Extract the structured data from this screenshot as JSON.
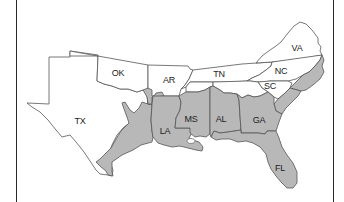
{
  "map": {
    "title": "",
    "colors": {
      "background": "#ffffff",
      "unshaded_fill": "#ffffff",
      "shaded_fill": "#b8b8b8",
      "border": "#555555",
      "frame": "#2a2a2a"
    },
    "states": [
      {
        "abbr": "TX",
        "shaded_region": "eastern coastal strip"
      },
      {
        "abbr": "OK",
        "shaded_region": "small southeastern corner"
      },
      {
        "abbr": "AR",
        "shaded_region": "southern edge"
      },
      {
        "abbr": "TN",
        "shaded_region": "none"
      },
      {
        "abbr": "VA",
        "shaded_region": "none"
      },
      {
        "abbr": "NC",
        "shaded_region": "eastern coastal plain"
      },
      {
        "abbr": "SC",
        "shaded_region": "southeastern coastal plain"
      },
      {
        "abbr": "LA",
        "shaded_region": "entire"
      },
      {
        "abbr": "MS",
        "shaded_region": "most"
      },
      {
        "abbr": "AL",
        "shaded_region": "southern portion"
      },
      {
        "abbr": "GA",
        "shaded_region": "southern portion"
      },
      {
        "abbr": "FL",
        "shaded_region": "entire"
      }
    ],
    "labels": {
      "TX": "TX",
      "OK": "OK",
      "AR": "AR",
      "TN": "TN",
      "VA": "VA",
      "NC": "NC",
      "SC": "SC",
      "LA": "LA",
      "MS": "MS",
      "AL": "AL",
      "GA": "GA",
      "FL": "FL"
    }
  }
}
